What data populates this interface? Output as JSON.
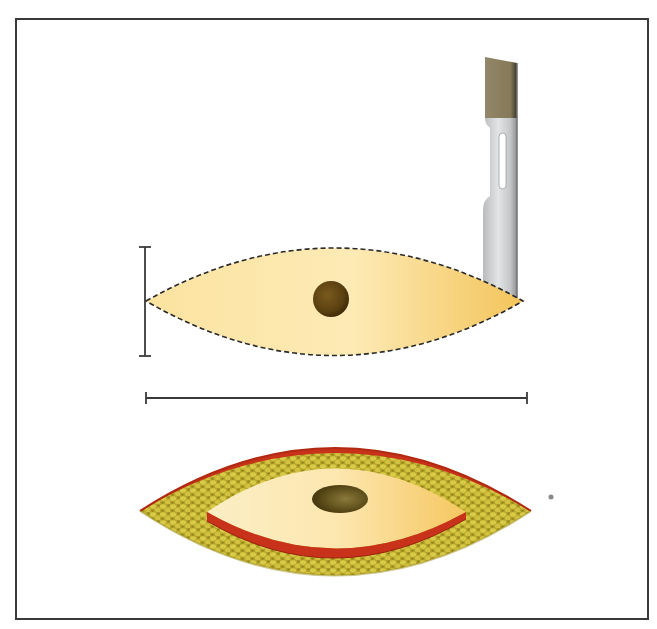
{
  "figure": {
    "panels": [
      {
        "id": "planned-excision",
        "label": "Planned elliptical incision with scalpel"
      },
      {
        "id": "excised-wound",
        "label": "Excised wound bed with ellipse of skin"
      }
    ],
    "dimensions": {
      "width_bar": "width",
      "length_bar": "length"
    }
  },
  "colors": {
    "skin_light": "#fdeab3",
    "skin_mid": "#f7d27a",
    "skin_dark": "#f2c25a",
    "lesion": "#5a3f10",
    "lesion_dark": "#3a2808",
    "fat": "#c8b634",
    "fat_dark": "#9e9022",
    "dermis_edge": "#c8321a",
    "blade_steel": "#c7c9cb",
    "blade_tip": "#8a7e5c",
    "outline": "#2a2a2a",
    "frame": "#3a3a3a"
  }
}
